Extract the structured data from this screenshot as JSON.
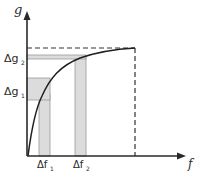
{
  "diagram": {
    "type": "function-sensitivity-plot",
    "y_axis": {
      "label": "g"
    },
    "x_axis": {
      "label": "f"
    },
    "y_markers": [
      {
        "label": "Δg",
        "subscript": "2"
      },
      {
        "label": "Δg",
        "subscript": "1"
      }
    ],
    "x_markers": [
      {
        "label": "Δf",
        "subscript": "1"
      },
      {
        "label": "Δf",
        "subscript": "2"
      }
    ],
    "colors": {
      "axis": "#2a2a2a",
      "curve": "#1e1e1e",
      "band_fill": "#dcdcdc",
      "band_stroke": "#9a9a9a",
      "dashed": "#333333"
    }
  }
}
